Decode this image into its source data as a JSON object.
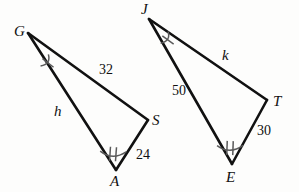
{
  "figure": {
    "type": "similar-triangles-diagram",
    "background_color": "#fdfdfc",
    "stroke_color": "#111111",
    "tick_color": "#4a4a4a",
    "triangles": [
      {
        "name": "triangle-gas",
        "vertices": [
          {
            "label": "G",
            "x": 28,
            "y": 33,
            "label_x": 14,
            "label_y": 24
          },
          {
            "label": "S",
            "x": 148,
            "y": 120,
            "label_x": 152,
            "label_y": 113
          },
          {
            "label": "A",
            "x": 116,
            "y": 170,
            "label_x": 110,
            "label_y": 174
          }
        ],
        "sides": [
          {
            "name": "side-gs",
            "label": "32",
            "label_x": 99,
            "label_y": 63
          },
          {
            "name": "side-ga",
            "label": "h",
            "label_x": 54,
            "label_y": 104,
            "italic": true
          },
          {
            "name": "side-as",
            "label": "24",
            "label_x": 136,
            "label_y": 148
          }
        ],
        "angle_marks": [
          {
            "name": "angle-mark-g",
            "ticks": 1,
            "x": 51,
            "y": 64,
            "rotation": 38
          },
          {
            "name": "angle-mark-a",
            "ticks": 2,
            "x": 113,
            "y": 154,
            "rotation": 4
          }
        ]
      },
      {
        "name": "triangle-jet",
        "vertices": [
          {
            "label": "J",
            "x": 149,
            "y": 19,
            "label_x": 141,
            "label_y": 2
          },
          {
            "label": "T",
            "x": 267,
            "y": 100,
            "label_x": 273,
            "label_y": 94
          },
          {
            "label": "E",
            "x": 232,
            "y": 164,
            "label_x": 226,
            "label_y": 170
          }
        ],
        "sides": [
          {
            "name": "side-jt",
            "label": "k",
            "label_x": 222,
            "label_y": 48,
            "italic": true
          },
          {
            "name": "side-je",
            "label": "50",
            "label_x": 172,
            "label_y": 84
          },
          {
            "name": "side-et",
            "label": "30",
            "label_x": 257,
            "label_y": 124
          }
        ],
        "angle_marks": [
          {
            "name": "angle-mark-j",
            "ticks": 1,
            "x": 171,
            "y": 41,
            "rotation": 36
          },
          {
            "name": "angle-mark-e",
            "ticks": 2,
            "x": 230,
            "y": 148,
            "rotation": 2
          }
        ]
      }
    ]
  },
  "labels": {
    "vertex_g": "G",
    "vertex_a": "A",
    "vertex_s": "S",
    "vertex_j": "J",
    "vertex_e": "E",
    "vertex_t": "T",
    "measure_gs": "32",
    "measure_ga": "h",
    "measure_as": "24",
    "measure_jt": "k",
    "measure_je": "50",
    "measure_et": "30"
  }
}
